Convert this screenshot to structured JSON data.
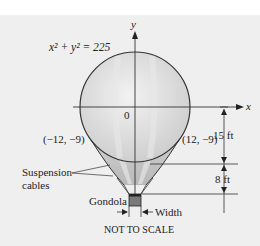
{
  "diagram": {
    "equation": {
      "text": "x² + y² = 225"
    },
    "axes": {
      "x_label": "x",
      "y_label": "y",
      "origin_label": "0"
    },
    "points": [
      {
        "label": "(−12, −9)",
        "x": -12,
        "y": -9
      },
      {
        "label": "(12, −9)",
        "x": 12,
        "y": -9
      }
    ],
    "dimensions": [
      {
        "label": "15 ft"
      },
      {
        "label": "8 ft"
      }
    ],
    "labels": {
      "suspension_cables": [
        "Suspension",
        "cables"
      ],
      "gondola": "Gondola",
      "width": "Width",
      "footer": "NOT TO SCALE"
    },
    "colors": {
      "panel_background": "#efefef",
      "balloon_fill": "#d9d9d9",
      "balloon_stripe": "#c4c4c4",
      "line": "#333333",
      "gondola": "#7a7a7a"
    }
  }
}
